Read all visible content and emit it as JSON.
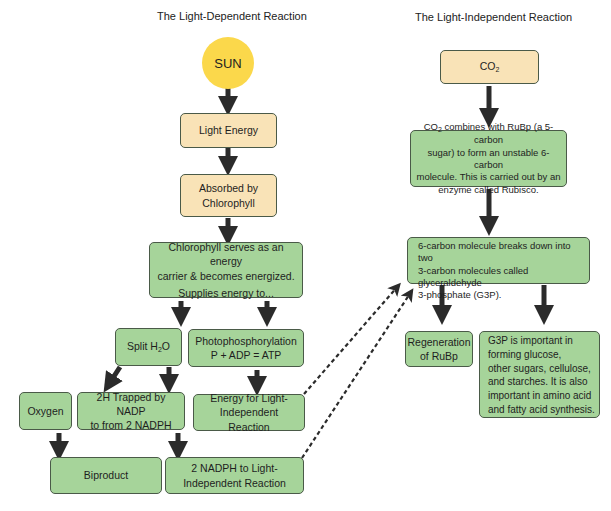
{
  "titles": {
    "light_dependent": "The Light-Dependent Reaction",
    "light_independent": "The Light-Independent Reaction"
  },
  "light_dependent": {
    "sun": "SUN",
    "light_energy": "Light Energy",
    "absorbed_line1": "Absorbed by",
    "absorbed_line2": "Chlorophyll",
    "chlorophyll_line1": "Chlorophyll serves as an energy",
    "chlorophyll_line2": "carrier & becomes energized.",
    "chlorophyll_line3": "Supplies energy to...",
    "split_prefix": "Split H",
    "split_sub": "2",
    "split_suffix": "O",
    "photo_line1": "Photophosphorylation",
    "photo_line2": "P + ADP = ATP",
    "oxygen": "Oxygen",
    "trapped_line1": "2H Trapped by NADP",
    "trapped_line2": "to from 2 NADPH",
    "energy_line1": "Energy for Light-",
    "energy_line2": "Independent Reaction",
    "biproduct": "Biproduct",
    "nadph_line1": "2 NADPH to Light-",
    "nadph_line2": "Independent Reaction"
  },
  "light_independent": {
    "co2_prefix": "CO",
    "co2_sub": "2",
    "combine_prefix": "CO",
    "combine_sub": "2",
    "combine_line1_rest": " combines with RuBp (a 5-carbon",
    "combine_line2": "sugar) to form an unstable 6-carbon",
    "combine_line3": "molecule. This is carried out by an",
    "combine_line4": "enzyme called Rubisco.",
    "breakdown_line1": "6-carbon molecule breaks down into two",
    "breakdown_line2": "3-carbon molecules called glyceraldehyde",
    "breakdown_line3": "3-phosphate (G3P).",
    "regen_line1": "Regeneration",
    "regen_line2": "of RuBp",
    "g3p_line1": "G3P is important in",
    "g3p_line2": "forming glucose,",
    "g3p_line3": "other sugars, cellulose,",
    "g3p_line4": "and starches. It is also",
    "g3p_line5": "important in amino acid",
    "g3p_line6": "and fatty acid synthesis."
  },
  "colors": {
    "tan_box": "#f9e3b7",
    "green_box": "#a6d49a",
    "sun": "#fbd84b",
    "arrow": "#2b2b2b"
  }
}
